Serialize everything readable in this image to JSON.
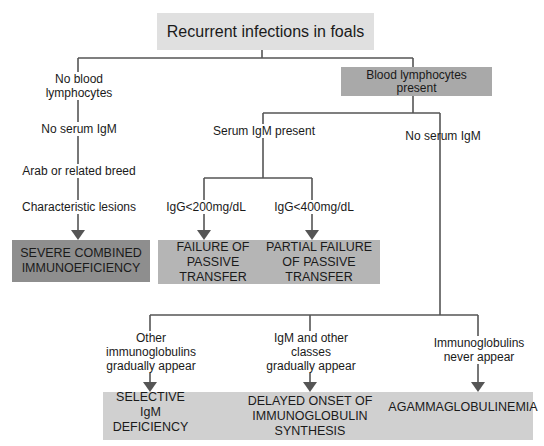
{
  "diagram": {
    "title": "Recurrent infections in foals",
    "colors": {
      "title_box": "#e0e0e0",
      "blood_lymph_box": "#a9a9a9",
      "scid_box": "#8e8e8e",
      "fpt_box": "#b5b5b5",
      "bottom_box": "#d0d0d0",
      "line": "#555555"
    },
    "left_branch": {
      "condition": "No blood lymphocytes",
      "steps": [
        "No serum IgM",
        "Arab or related breed",
        "Characteristic lesions"
      ],
      "outcome": "SEVERE COMBINED IMMUNOEFICIENCY"
    },
    "right_branch": {
      "node": "Blood lymphocytes present",
      "igm_present": {
        "label": "Serum IgM present",
        "branches": [
          {
            "condition": "IgG<200mg/dL",
            "outcome": "FAILURE OF PASSIVE TRANSFER"
          },
          {
            "condition": "IgG<400mg/dL",
            "outcome": "PARTIAL FAILURE OF PASSIVE TRANSFER"
          }
        ]
      },
      "no_igm": {
        "label": "No serum IgM",
        "branches": [
          {
            "condition": "Other immunoglobulins gradually appear",
            "outcome": "SELECTIVE IgM DEFICIENCY"
          },
          {
            "condition": "IgM and other classes gradually appear",
            "outcome": "DELAYED ONSET OF IMMUNOGLOBULIN SYNTHESIS"
          },
          {
            "condition": "Immunoglobulins never appear",
            "outcome": "AGAMMAGLOBULINEMIA"
          }
        ]
      }
    }
  }
}
